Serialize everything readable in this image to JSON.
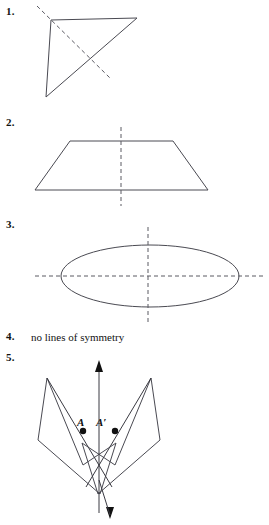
{
  "page": {
    "background_color": "#ffffff",
    "ink_color": "#3a3a42",
    "dash_color": "#5a5a62",
    "width": 269,
    "height": 525
  },
  "items": [
    {
      "number": "1.",
      "answer_text": "",
      "figure": "scalene-triangle-with-one-dashed-line"
    },
    {
      "number": "2.",
      "answer_text": "",
      "figure": "isosceles-trapezoid-with-vertical-dashed-line"
    },
    {
      "number": "3.",
      "answer_text": "",
      "figure": "ellipse-with-two-dashed-lines"
    },
    {
      "number": "4.",
      "answer_text": "no lines of symmetry",
      "figure": "none"
    },
    {
      "number": "5.",
      "answer_text": "",
      "figure": "reflected-polygon-pair-with-line-of-reflection"
    }
  ],
  "figure5": {
    "point_a_label": "A",
    "point_a_prime_label": "A′"
  }
}
